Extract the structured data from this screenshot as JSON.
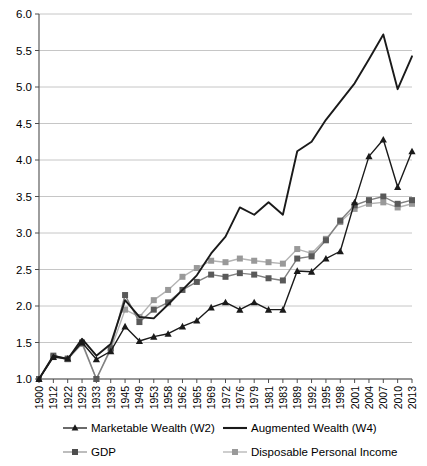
{
  "chart_data": {
    "type": "line",
    "title": "",
    "xlabel": "",
    "ylabel": "",
    "ylim": [
      1.0,
      6.0
    ],
    "ytick_step": 0.5,
    "grid": true,
    "legend_position": "bottom",
    "yticks": [
      "6.0",
      "5.5",
      "5.0",
      "4.5",
      "4.0",
      "3.5",
      "3.0",
      "2.5",
      "2.0",
      "1.5",
      "1.0"
    ],
    "categories": [
      "1900",
      "1912",
      "1922",
      "1929",
      "1933",
      "1939",
      "1945",
      "1949",
      "1953",
      "1958",
      "1962",
      "1965",
      "1969",
      "1972",
      "1976",
      "1979",
      "1981",
      "1983",
      "1989",
      "1992",
      "1995",
      "1998",
      "2001",
      "2004",
      "2007",
      "2010",
      "2013"
    ],
    "series": [
      {
        "name": "Marketable Wealth (W2)",
        "color": "#1a1a1a",
        "marker": "triangle",
        "values": [
          1.0,
          1.3,
          1.28,
          1.5,
          1.27,
          1.38,
          1.72,
          1.52,
          1.58,
          1.62,
          1.72,
          1.8,
          1.98,
          2.05,
          1.95,
          2.05,
          1.95,
          1.95,
          2.48,
          2.47,
          2.65,
          2.75,
          3.42,
          4.05,
          4.28,
          3.63,
          4.12
        ]
      },
      {
        "name": "Augmented Wealth (W4)",
        "color": "#1a1a1a",
        "marker": "none",
        "values": [
          1.0,
          1.32,
          1.27,
          1.55,
          1.32,
          1.48,
          2.08,
          1.85,
          1.83,
          2.02,
          2.22,
          2.42,
          2.72,
          2.95,
          3.35,
          3.25,
          3.42,
          3.25,
          4.12,
          4.25,
          4.55,
          4.8,
          5.05,
          5.38,
          5.72,
          4.97,
          5.42
        ]
      },
      {
        "name": "GDP",
        "color": "#595959",
        "marker": "square",
        "values": [
          1.0,
          1.32,
          1.28,
          1.5,
          1.0,
          1.42,
          2.15,
          1.78,
          1.95,
          2.05,
          2.22,
          2.33,
          2.43,
          2.4,
          2.45,
          2.43,
          2.38,
          2.35,
          2.65,
          2.68,
          2.9,
          3.17,
          3.38,
          3.45,
          3.5,
          3.4,
          3.45
        ]
      },
      {
        "name": "Disposable Personal Income",
        "color": "#999999",
        "marker": "square",
        "values": [
          1.0,
          1.3,
          1.27,
          1.48,
          1.0,
          1.4,
          1.95,
          1.85,
          2.08,
          2.22,
          2.4,
          2.52,
          2.62,
          2.6,
          2.65,
          2.62,
          2.6,
          2.58,
          2.78,
          2.72,
          2.92,
          3.15,
          3.33,
          3.4,
          3.42,
          3.35,
          3.4
        ]
      }
    ]
  },
  "axes": {
    "y_axis_name": "index-value-axis",
    "x_axis_name": "year-axis"
  },
  "legend": {
    "items": [
      {
        "label": "Marketable Wealth (W2)",
        "marker": "triangle",
        "color": "#1a1a1a"
      },
      {
        "label": "Augmented Wealth (W4)",
        "marker": "none",
        "color": "#1a1a1a"
      },
      {
        "label": "GDP",
        "marker": "square",
        "color": "#595959"
      },
      {
        "label": "Disposable Personal Income",
        "marker": "square",
        "color": "#999999"
      }
    ]
  }
}
